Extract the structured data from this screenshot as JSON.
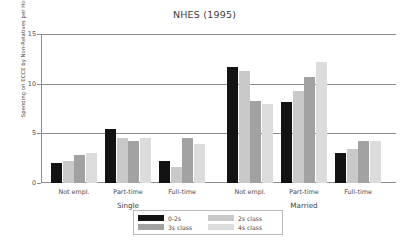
{
  "chart_data": {
    "type": "bar",
    "title": "NHES (1995)",
    "xlabel": "",
    "ylabel": "Spending on ECCE by Non-Relatives per Hour",
    "ylim": [
      0,
      15
    ],
    "yticks": [
      "0",
      "5",
      "10",
      "15"
    ],
    "grid": true,
    "legend_position": "bottom-center",
    "group_labels": [
      "Single",
      "Married"
    ],
    "categories": [
      "Not empl.",
      "Part-time",
      "Full-time",
      "Not empl.",
      "Part-time",
      "Full-time"
    ],
    "series": [
      {
        "name": "0-2s",
        "color": "#131313",
        "values": [
          2.0,
          5.4,
          2.2,
          11.7,
          8.2,
          3.0
        ]
      },
      {
        "name": "2s class",
        "color": "#c9c9c9",
        "values": [
          2.2,
          4.5,
          1.6,
          11.3,
          9.3,
          3.4
        ]
      },
      {
        "name": "3s class",
        "color": "#a2a2a2",
        "values": [
          2.8,
          4.2,
          4.5,
          8.3,
          10.7,
          4.2
        ]
      },
      {
        "name": "4s class",
        "color": "#dcdcdc",
        "values": [
          3.0,
          4.5,
          3.9,
          8.0,
          12.2,
          4.2
        ]
      }
    ]
  },
  "legend": {
    "entries": [
      {
        "label": "0-2s"
      },
      {
        "label": "2s class"
      },
      {
        "label": "3s class"
      },
      {
        "label": "4s class"
      }
    ]
  }
}
